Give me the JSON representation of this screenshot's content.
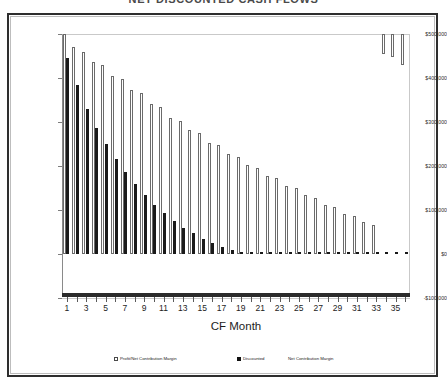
{
  "chart": {
    "title": "NET DISCOUNTED CASH FLOWS",
    "xlabel": "CF Month",
    "ylabel": "",
    "y_ticks": [
      "$500,000",
      "$400,000",
      "$300,000",
      "$200,000",
      "$100,000",
      "$0",
      "-$100,000"
    ],
    "x_ticks": [
      "1",
      "3",
      "5",
      "7",
      "9",
      "11",
      "13",
      "15",
      "17",
      "19",
      "21",
      "23",
      "25",
      "27",
      "29",
      "31",
      "33",
      "35"
    ]
  },
  "legend": {
    "items": [
      {
        "label": "Profit/Net Contribution Margin",
        "swatch": "white"
      },
      {
        "label": "Discounted",
        "swatch": "black"
      },
      {
        "label": "Net Contribution Margin",
        "swatch": "none"
      }
    ]
  },
  "colors": {
    "series_white": "#ffffff",
    "series_black": "#1a1a1a",
    "outline": "#6b6b6b",
    "grid": "#c9c9c9",
    "axis": "#2b2b2b",
    "frame": "#2e2e2e"
  },
  "chart_data": {
    "type": "bar",
    "title": "NET DISCOUNTED CASH FLOWS",
    "xlabel": "CF Month",
    "ylabel": "",
    "ylim": [
      -100000,
      500000
    ],
    "grid": true,
    "legend_position": "bottom",
    "categories": [
      1,
      2,
      3,
      4,
      5,
      6,
      7,
      8,
      9,
      10,
      11,
      12,
      13,
      14,
      15,
      16,
      17,
      18,
      19,
      20,
      21,
      22,
      23,
      24,
      25,
      26,
      27,
      28,
      29,
      30,
      31,
      32,
      33,
      34,
      35,
      36
    ],
    "series": [
      {
        "name": "Profit/Net Contribution Margin",
        "style": "white",
        "values": [
          500000,
          470000,
          458000,
          437000,
          430000,
          404000,
          398000,
          372000,
          365000,
          340000,
          333000,
          310000,
          303000,
          281000,
          274000,
          253000,
          247000,
          227000,
          221000,
          202000,
          196000,
          178000,
          172000,
          155000,
          149000,
          133000,
          127000,
          112000,
          106000,
          92000,
          86000,
          72000,
          66000,
          -46000,
          -52000,
          -70000
        ]
      },
      {
        "name": "Discounted Net Contribution Margin",
        "style": "black",
        "values": [
          445000,
          385000,
          330000,
          287000,
          250000,
          215000,
          186000,
          158000,
          134000,
          112000,
          93000,
          76000,
          60000,
          47000,
          35000,
          25000,
          17000,
          10000,
          5000,
          2000,
          1000,
          500,
          300,
          200,
          150,
          100,
          80,
          60,
          50,
          40,
          30,
          25,
          20,
          15,
          10,
          8
        ]
      }
    ]
  }
}
